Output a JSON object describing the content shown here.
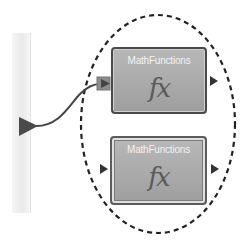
{
  "canvas": {
    "background": "#ffffff",
    "group_outline": "dashed-ellipse",
    "outline_color": "#222222"
  },
  "input_rail": {
    "port_color": "#4a4a4a",
    "rail_color": "#eeeeee"
  },
  "nodes": [
    {
      "title": "MathFunctions",
      "icon": "function-fx-icon",
      "icon_text": "fx",
      "input_port": "connected",
      "output_port": "arrow"
    },
    {
      "title": "MathFunctions",
      "icon": "function-fx-icon",
      "icon_text": "fx",
      "input_port": "arrow",
      "output_port": "arrow"
    }
  ],
  "connections": [
    {
      "from": "input_rail.port",
      "to": "nodes.0.input_port"
    }
  ],
  "colors": {
    "node_fill": "#a8a8a8",
    "node_border": "#4a4a4a",
    "node_title": "#f2f2f2",
    "fx_color": "#5a5a5a",
    "wire": "#444444",
    "input_port_fill": "#8c8c8c"
  }
}
